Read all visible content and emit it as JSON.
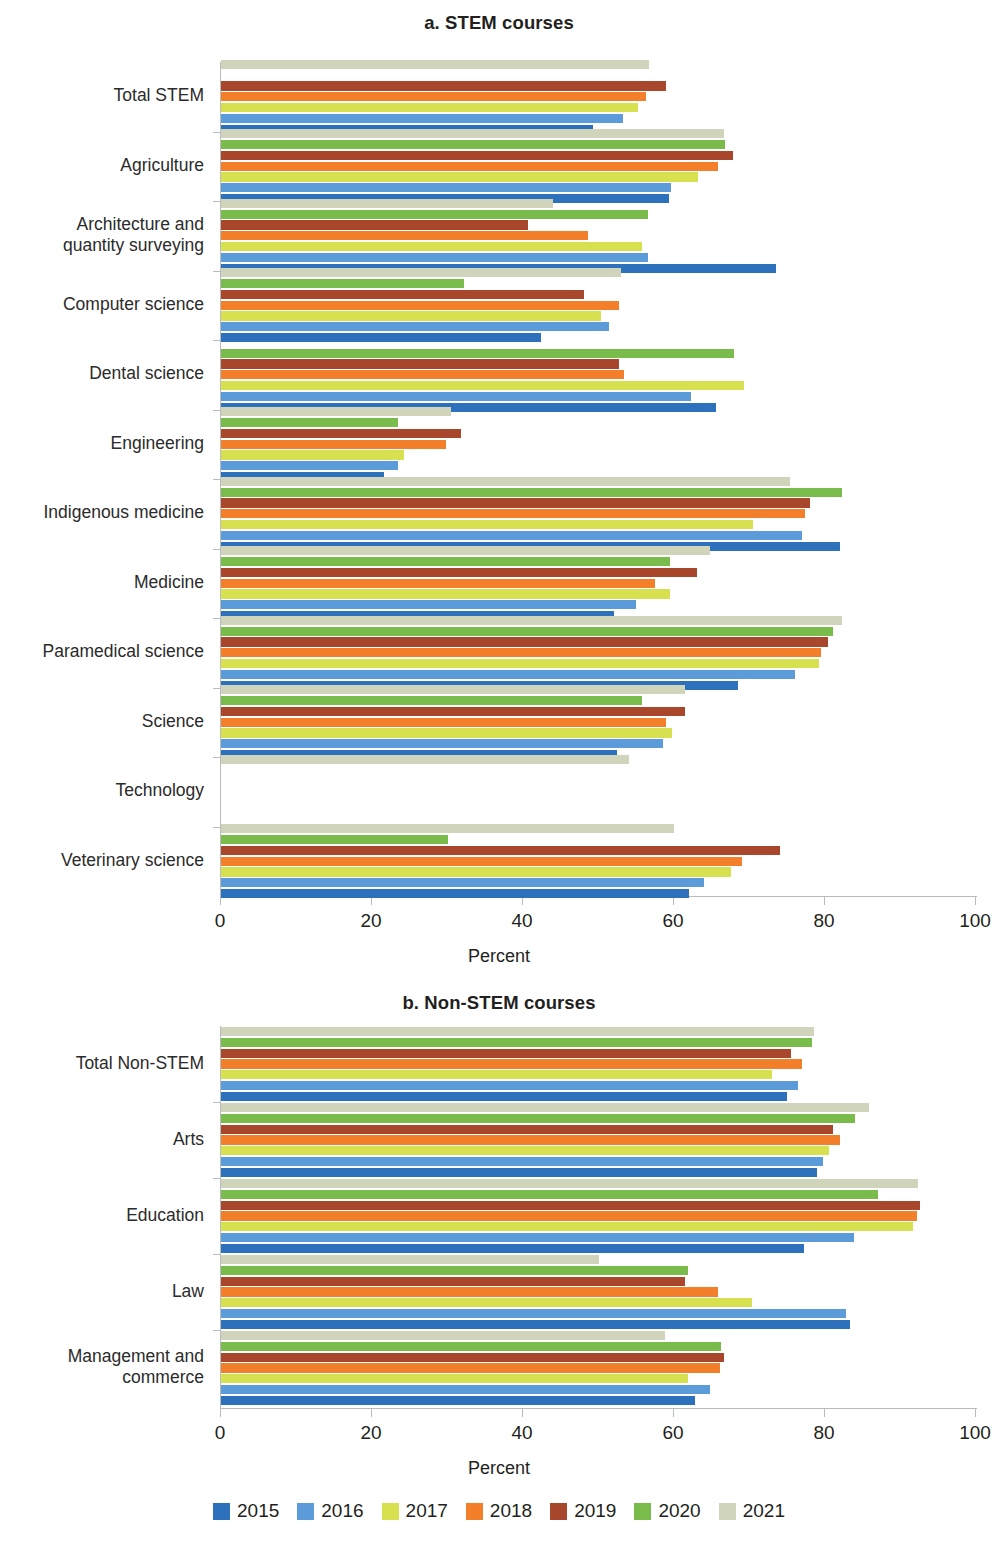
{
  "chart_data": [
    {
      "type": "bar",
      "orientation": "horizontal",
      "title": "a. STEM courses",
      "xlabel": "Percent",
      "ylabel": "",
      "xlim": [
        0,
        100
      ],
      "xticks": [
        0,
        20,
        40,
        60,
        80,
        100
      ],
      "grid": false,
      "legend_position": "bottom",
      "categories": [
        "Total STEM",
        "Agriculture",
        "Architecture and\nquantity surveying",
        "Computer science",
        "Dental science",
        "Engineering",
        "Indigenous medicine",
        "Medicine",
        "Paramedical science",
        "Science",
        "Technology",
        "Veterinary science"
      ],
      "series": [
        {
          "name": "2015",
          "color": "#2d70bb",
          "values": [
            49.3,
            59.3,
            73.5,
            42.4,
            65.6,
            21.6,
            82.0,
            52.0,
            68.5,
            52.5,
            null,
            62.0
          ]
        },
        {
          "name": "2016",
          "color": "#5b9bd9",
          "values": [
            53.2,
            59.6,
            56.6,
            51.4,
            62.3,
            23.5,
            77.0,
            55.0,
            76.0,
            58.5,
            null,
            64.0
          ]
        },
        {
          "name": "2017",
          "color": "#d7e04e",
          "values": [
            55.2,
            63.2,
            55.8,
            50.3,
            69.3,
            24.3,
            70.5,
            59.5,
            79.2,
            59.8,
            null,
            67.5
          ]
        },
        {
          "name": "2018",
          "color": "#f37f2a",
          "values": [
            56.3,
            65.8,
            48.6,
            52.7,
            53.4,
            29.8,
            77.3,
            57.5,
            79.5,
            59.0,
            null,
            69.0
          ]
        },
        {
          "name": "2019",
          "color": "#a8472c",
          "values": [
            58.9,
            67.8,
            40.7,
            48.1,
            52.7,
            31.8,
            78.0,
            63.0,
            80.4,
            61.5,
            null,
            74.0
          ]
        },
        {
          "name": "2020",
          "color": "#79bc4b",
          "values": [
            null,
            66.8,
            56.6,
            32.2,
            67.9,
            23.5,
            82.3,
            59.5,
            81.0,
            55.8,
            null,
            30.0
          ]
        },
        {
          "name": "2021",
          "color": "#cfd4bb",
          "values": [
            56.7,
            66.6,
            44.0,
            53.0,
            null,
            30.5,
            75.3,
            64.8,
            82.3,
            61.5,
            54.0,
            60.0
          ]
        }
      ]
    },
    {
      "type": "bar",
      "orientation": "horizontal",
      "title": "b. Non-STEM courses",
      "xlabel": "Percent",
      "ylabel": "",
      "xlim": [
        0,
        100
      ],
      "xticks": [
        0,
        20,
        40,
        60,
        80,
        100
      ],
      "grid": false,
      "legend_position": "bottom",
      "categories": [
        "Total Non-STEM",
        "Arts",
        "Education",
        "Law",
        "Management and\ncommerce"
      ],
      "series": [
        {
          "name": "2015",
          "color": "#2d70bb",
          "values": [
            75.0,
            79.0,
            77.2,
            83.3,
            62.8
          ]
        },
        {
          "name": "2016",
          "color": "#5b9bd9",
          "values": [
            76.4,
            79.8,
            83.8,
            82.8,
            64.8
          ]
        },
        {
          "name": "2017",
          "color": "#d7e04e",
          "values": [
            73.0,
            80.5,
            91.6,
            70.3,
            61.9
          ]
        },
        {
          "name": "2018",
          "color": "#f37f2a",
          "values": [
            77.0,
            82.0,
            92.2,
            65.8,
            66.1
          ]
        },
        {
          "name": "2019",
          "color": "#a8472c",
          "values": [
            75.5,
            81.0,
            92.6,
            61.5,
            66.6
          ]
        },
        {
          "name": "2020",
          "color": "#79bc4b",
          "values": [
            78.3,
            84.0,
            87.0,
            61.8,
            66.2
          ]
        },
        {
          "name": "2021",
          "color": "#cfd4bb",
          "values": [
            78.6,
            85.8,
            92.3,
            50.0,
            58.8
          ]
        }
      ]
    }
  ],
  "panel_a": {
    "title": "a. STEM courses",
    "xlabel": "Percent",
    "xticks": [
      "0",
      "20",
      "40",
      "60",
      "80",
      "100"
    ],
    "categories": [
      "Total STEM",
      "Agriculture",
      "Architecture and\nquantity surveying",
      "Computer science",
      "Dental science",
      "Engineering",
      "Indigenous medicine",
      "Medicine",
      "Paramedical science",
      "Science",
      "Technology",
      "Veterinary science"
    ]
  },
  "panel_b": {
    "title": "b. Non-STEM courses",
    "xlabel": "Percent",
    "xticks": [
      "0",
      "20",
      "40",
      "60",
      "80",
      "100"
    ],
    "categories": [
      "Total Non-STEM",
      "Arts",
      "Education",
      "Law",
      "Management and\ncommerce"
    ]
  },
  "legend": {
    "items": [
      {
        "label": "2015",
        "color": "#2d70bb"
      },
      {
        "label": "2016",
        "color": "#5b9bd9"
      },
      {
        "label": "2017",
        "color": "#d7e04e"
      },
      {
        "label": "2018",
        "color": "#f37f2a"
      },
      {
        "label": "2019",
        "color": "#a8472c"
      },
      {
        "label": "2020",
        "color": "#79bc4b"
      },
      {
        "label": "2021",
        "color": "#cfd4bb"
      }
    ]
  }
}
